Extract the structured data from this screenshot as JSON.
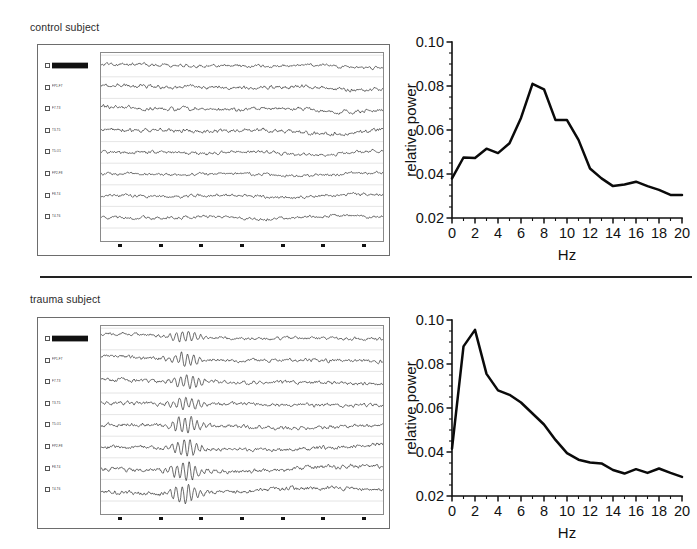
{
  "figure": {
    "panels": [
      {
        "id": "control",
        "caption": "control subject",
        "eeg": {
          "channel_labels": [
            "",
            "FP1-F7",
            "F7-T3",
            "T3-T5",
            "T5-O1",
            "FP2-F8",
            "F8-T4",
            "T4-T6",
            "T6-O2"
          ],
          "time_ticks": [
            "",
            "",
            "",
            "",
            "",
            "",
            ""
          ]
        }
      },
      {
        "id": "trauma",
        "caption": "trauma subject",
        "eeg": {
          "channel_labels": [
            "",
            "FP1-F7",
            "F7-T3",
            "T3-T5",
            "T5-O1",
            "FP2-F8",
            "F8-T4",
            "T4-T6",
            "T6-O2"
          ],
          "time_ticks": [
            "",
            "",
            "",
            "",
            "",
            "",
            ""
          ]
        }
      }
    ]
  },
  "chart_data": [
    {
      "id": "control-spectrum",
      "type": "line",
      "title": "",
      "xlabel": "Hz",
      "ylabel": "relative power",
      "xlim": [
        0,
        20
      ],
      "ylim": [
        0.02,
        0.1
      ],
      "xticks": [
        0,
        2,
        4,
        6,
        8,
        10,
        12,
        14,
        16,
        18,
        20
      ],
      "xtick_labels": [
        "0",
        "2",
        "4",
        "6",
        "8",
        "10",
        "12",
        "14",
        "16",
        "18",
        "20"
      ],
      "yticks": [
        0.02,
        0.04,
        0.06,
        0.08,
        0.1
      ],
      "ytick_labels": [
        "0.02",
        "0.04",
        "0.06",
        "0.08",
        "0.10"
      ],
      "x_minor_step": 1,
      "y_minor_step": 0.005,
      "grid": false,
      "legend": null,
      "x": [
        0,
        1,
        2,
        3,
        4,
        5,
        6,
        7,
        8,
        9,
        10,
        11,
        12,
        13,
        14,
        15,
        16,
        17,
        18,
        19,
        20
      ],
      "values": [
        0.038,
        0.0475,
        0.0473,
        0.0515,
        0.0495,
        0.054,
        0.0655,
        0.081,
        0.0785,
        0.0645,
        0.0645,
        0.0555,
        0.0425,
        0.038,
        0.0345,
        0.0352,
        0.0365,
        0.0345,
        0.0328,
        0.0305,
        0.0305
      ]
    },
    {
      "id": "trauma-spectrum",
      "type": "line",
      "title": "",
      "xlabel": "Hz",
      "ylabel": "relative power",
      "xlim": [
        0,
        20
      ],
      "ylim": [
        0.02,
        0.1
      ],
      "xticks": [
        0,
        2,
        4,
        6,
        8,
        10,
        12,
        14,
        16,
        18,
        20
      ],
      "xtick_labels": [
        "0",
        "2",
        "4",
        "6",
        "8",
        "10",
        "12",
        "14",
        "16",
        "18",
        "20"
      ],
      "yticks": [
        0.02,
        0.04,
        0.06,
        0.08,
        0.1
      ],
      "ytick_labels": [
        "0.02",
        "0.04",
        "0.06",
        "0.08",
        "0.10"
      ],
      "x_minor_step": 1,
      "y_minor_step": 0.005,
      "grid": false,
      "legend": null,
      "x": [
        0,
        1,
        2,
        3,
        4,
        5,
        6,
        7,
        8,
        9,
        10,
        11,
        12,
        13,
        14,
        15,
        16,
        17,
        18,
        19,
        20
      ],
      "values": [
        0.0415,
        0.088,
        0.0955,
        0.0755,
        0.068,
        0.066,
        0.0625,
        0.0575,
        0.0525,
        0.0455,
        0.0395,
        0.0365,
        0.0352,
        0.0348,
        0.0318,
        0.0302,
        0.0322,
        0.0305,
        0.0325,
        0.0305,
        0.0287
      ]
    }
  ]
}
